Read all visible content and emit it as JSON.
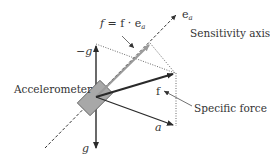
{
  "diagram": {
    "type": "vector-diagram",
    "labels": {
      "projection_formula": "f = f · e",
      "projection_formula_f_italic": "f",
      "projection_formula_eq": " = f · e",
      "projection_formula_sub": "a",
      "axis_unit": "e",
      "axis_unit_sub": "a",
      "sensitivity_axis": "Sensitivity axis",
      "neg_gravity": "−g",
      "gravity": "g",
      "accelerometer": "Accelerometer",
      "specific_force_symbol": "f",
      "specific_force": "Specific force",
      "acceleration": "a"
    },
    "colors": {
      "dark_vector": "#2a2a2a",
      "projection_vector": "#9a9a9a",
      "box_fill": "#a8a8a8",
      "box_stroke": "#555555",
      "text": "#333333"
    }
  }
}
